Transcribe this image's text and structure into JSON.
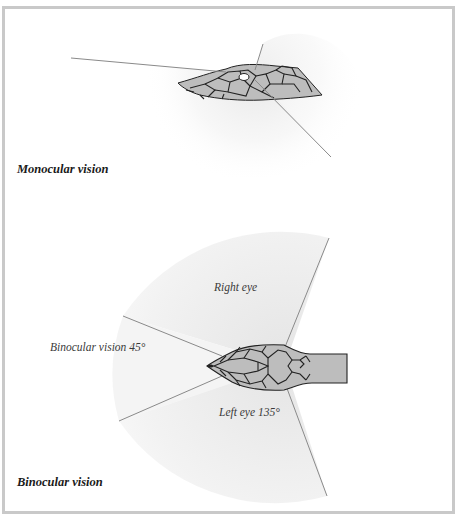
{
  "panels": {
    "monocular": {
      "caption": "Monocular vision"
    },
    "binocular": {
      "caption": "Binocular vision",
      "labels": {
        "right_eye": "Right eye",
        "binocular_angle": "Binocular vision 45°",
        "left_eye": "Left eye 135°"
      }
    }
  },
  "colors": {
    "frame": "#c9c9c9",
    "field_shade": "#ebebeb",
    "sight_line": "#8a8a8a",
    "scale_fill": "#bdbdbd",
    "scale_outline": "#222222"
  }
}
